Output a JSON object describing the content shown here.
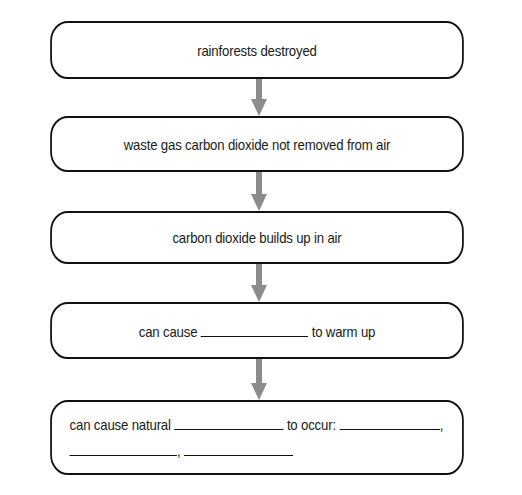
{
  "diagram": {
    "type": "flowchart",
    "direction": "top-to-bottom",
    "colors": {
      "box_border": "#111111",
      "box_fill": "#ffffff",
      "arrow": "#8c8c8c",
      "text": "#1a1a1a"
    },
    "steps": [
      {
        "text": "rainforests destroyed"
      },
      {
        "text": "waste gas carbon dioxide not removed from air"
      },
      {
        "text": "carbon dioxide builds up in air"
      },
      {
        "prefix": "can cause",
        "suffix": "to warm up",
        "blank_value": ""
      },
      {
        "prefix": "can cause natural",
        "middle": "to occur:",
        "separator_1": ",",
        "separator_2": ",",
        "blank_values": [
          "",
          "",
          "",
          ""
        ]
      }
    ],
    "arrows": [
      {
        "from": 0,
        "to": 1
      },
      {
        "from": 1,
        "to": 2
      },
      {
        "from": 2,
        "to": 3
      },
      {
        "from": 3,
        "to": 4
      }
    ]
  }
}
